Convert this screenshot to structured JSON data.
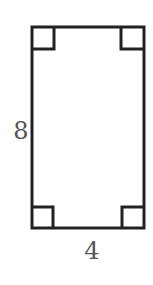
{
  "diagram": {
    "shape": "rectangle",
    "stroke_color": "#222222",
    "label_color": "#555555",
    "right_angle_markers": 4,
    "side_labels": {
      "left": "8",
      "bottom": "4"
    }
  }
}
